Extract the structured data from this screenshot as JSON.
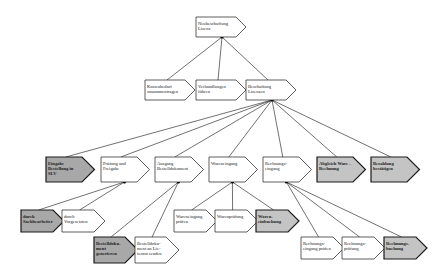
{
  "diagram": {
    "nodes": [
      {
        "id": "root",
        "lines": [
          "Neubeschaffung",
          "Lizenz"
        ],
        "style": "white",
        "parent": null
      },
      {
        "id": "kosten",
        "lines": [
          "Kostenbedarf",
          "zusammentragen"
        ],
        "style": "white",
        "parent": "root"
      },
      {
        "id": "verhand",
        "lines": [
          "Verhandlungen",
          "führen"
        ],
        "style": "white",
        "parent": "root"
      },
      {
        "id": "beschaff",
        "lines": [
          "Beschaffung",
          "Lizenzen"
        ],
        "style": "white",
        "parent": "root"
      },
      {
        "id": "eingabe",
        "lines": [
          "Eingabe",
          "Bestellung in",
          "SLV"
        ],
        "style": "dark",
        "parent": "beschaff"
      },
      {
        "id": "pruefung",
        "lines": [
          "Prüfung und",
          "Freigabe"
        ],
        "style": "white",
        "parent": "beschaff"
      },
      {
        "id": "ausgang",
        "lines": [
          "Ausgang",
          "Bestelldokument"
        ],
        "style": "white",
        "parent": "beschaff"
      },
      {
        "id": "wareneingang",
        "lines": [
          "Wareneingang"
        ],
        "style": "white",
        "parent": "beschaff"
      },
      {
        "id": "rechnungseingang",
        "lines": [
          "Rechnungs-",
          "eingang"
        ],
        "style": "white",
        "parent": "beschaff"
      },
      {
        "id": "abgleich",
        "lines": [
          "Abgleich Ware -",
          "Rechnung"
        ],
        "style": "gray",
        "parent": "beschaff"
      },
      {
        "id": "bezahlung",
        "lines": [
          "Bezahlung",
          "bestätigen"
        ],
        "style": "gray",
        "parent": "beschaff"
      },
      {
        "id": "sachbearbeiter",
        "lines": [
          "durch",
          "Sachbearbeiter"
        ],
        "style": "dark",
        "parent": "pruefung"
      },
      {
        "id": "vorgesetzten",
        "lines": [
          "durch",
          "Vorgesetzten"
        ],
        "style": "white",
        "parent": "pruefung"
      },
      {
        "id": "bestelldok_gen",
        "lines": [
          "Bestelldoku-",
          "ment",
          "generieren"
        ],
        "style": "dark",
        "parent": "ausgang"
      },
      {
        "id": "bestelldok_send",
        "lines": [
          "Bestelldoku-",
          "ment an Lie-",
          "ferant senden"
        ],
        "style": "white",
        "parent": "ausgang"
      },
      {
        "id": "we_pruefen",
        "lines": [
          "Wareneingang",
          "prüfen"
        ],
        "style": "white",
        "parent": "wareneingang"
      },
      {
        "id": "warenpruefung",
        "lines": [
          "Warenprüfung"
        ],
        "style": "white",
        "parent": "wareneingang"
      },
      {
        "id": "warenbuchung",
        "lines": [
          "Waren-",
          "einbuchung"
        ],
        "style": "gray",
        "parent": "wareneingang"
      },
      {
        "id": "re_pruefen",
        "lines": [
          "Rechnungs-",
          "eingang prüfen"
        ],
        "style": "white",
        "parent": "rechnungseingang"
      },
      {
        "id": "re_pruefung",
        "lines": [
          "Rechnungs-",
          "prüfung"
        ],
        "style": "white",
        "parent": "rechnungseingang"
      },
      {
        "id": "re_buchung",
        "lines": [
          "Rechnungs-",
          "buchung"
        ],
        "style": "gray",
        "parent": "rechnungseingang"
      }
    ],
    "colors": {
      "white": "#ffffff",
      "gray": "#c4c4c4",
      "dark": "#a8a8a8",
      "stroke": "#1a1a1a",
      "line": "#333333"
    }
  }
}
